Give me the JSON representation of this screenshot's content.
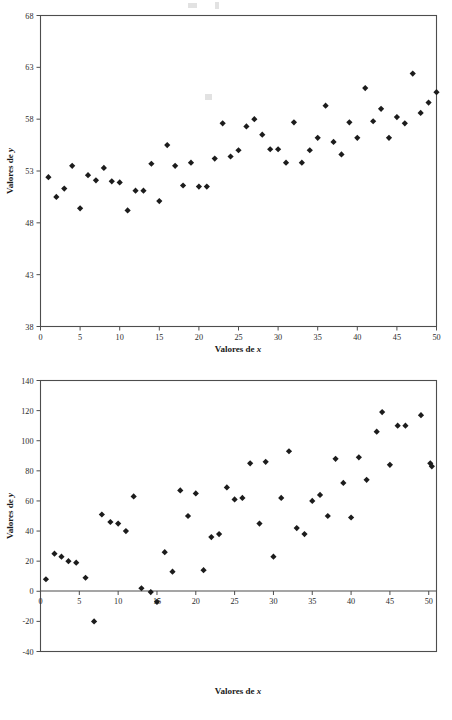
{
  "document": {
    "figure_count": 2,
    "background_color": "#ffffff",
    "marker_color": "#1c1c1c",
    "axis_color": "#4d4d4d"
  },
  "figures": [
    {
      "id": "figure-top",
      "xlabel_prefix": "Valores de ",
      "xlabel_var": "x",
      "ylabel_prefix": "Valores de ",
      "ylabel_var": "y"
    },
    {
      "id": "figure-bottom",
      "xlabel_prefix": "Valores de ",
      "xlabel_var": "x",
      "ylabel_prefix": "Valores de ",
      "ylabel_var": "y"
    }
  ],
  "chart_data": [
    {
      "type": "scatter",
      "title": "",
      "xlabel": "Valores de x",
      "ylabel": "Valores de y",
      "xlim": [
        0,
        50
      ],
      "ylim": [
        38,
        68
      ],
      "xticks": [
        0,
        5,
        10,
        15,
        20,
        25,
        30,
        35,
        40,
        45,
        50
      ],
      "yticks": [
        38,
        43,
        48,
        53,
        58,
        63,
        68
      ],
      "grid": false,
      "legend": null,
      "marker": "diamond",
      "series": [
        {
          "name": "y vs x",
          "x": [
            1,
            2,
            3,
            4,
            5,
            6,
            7,
            8,
            9,
            10,
            11,
            12,
            13,
            14,
            15,
            16,
            17,
            18,
            19,
            20,
            21,
            22,
            23,
            24,
            25,
            26,
            27,
            28,
            29,
            30,
            31,
            32,
            33,
            34,
            35,
            36,
            37,
            38,
            39,
            40,
            41,
            42,
            43,
            44,
            45,
            46,
            47,
            48,
            49,
            50
          ],
          "y": [
            52.4,
            50.5,
            51.3,
            53.5,
            49.4,
            52.6,
            52.1,
            53.3,
            52.0,
            51.9,
            49.2,
            51.1,
            51.1,
            53.7,
            50.1,
            55.5,
            53.5,
            51.6,
            53.8,
            51.5,
            51.5,
            54.2,
            57.6,
            54.4,
            55.0,
            57.3,
            58.0,
            56.5,
            55.1,
            55.1,
            53.8,
            57.7,
            53.8,
            55.0,
            56.2,
            59.3,
            55.8,
            54.6,
            57.7,
            56.2,
            61.0,
            57.8,
            59.0,
            56.2,
            58.2,
            57.6,
            62.4,
            58.6,
            59.6,
            60.6
          ]
        }
      ]
    },
    {
      "type": "scatter",
      "title": "",
      "xlabel": "Valores de x",
      "ylabel": "Valores de y",
      "xlim": [
        0,
        51
      ],
      "ylim": [
        -40,
        140
      ],
      "xticks": [
        0,
        5,
        10,
        15,
        20,
        25,
        30,
        35,
        40,
        45,
        50
      ],
      "yticks": [
        -40,
        -20,
        0,
        20,
        40,
        60,
        80,
        100,
        120,
        140
      ],
      "grid": false,
      "legend": null,
      "marker": "diamond",
      "series": [
        {
          "name": "y vs x",
          "x": [
            0.7,
            1.8,
            2.7,
            3.6,
            4.6,
            5.8,
            6.9,
            7.9,
            9.0,
            10.0,
            11.0,
            12.0,
            13.0,
            14.2,
            15.0,
            16.0,
            17.0,
            18.0,
            19.0,
            20.0,
            21.0,
            22.0,
            23.0,
            24.0,
            25.0,
            26.0,
            27.0,
            28.2,
            29.0,
            30.0,
            31.0,
            32.0,
            33.0,
            34.0,
            35.0,
            36.0,
            37.0,
            38.0,
            39.0,
            40.0,
            41.0,
            42.0,
            43.3,
            44.0,
            45.0,
            46.0,
            47.0,
            49.0,
            50.2,
            50.4
          ],
          "y": [
            8,
            25,
            23,
            20,
            19,
            9,
            -20,
            51,
            46,
            45,
            40,
            63,
            2,
            -0.5,
            -7,
            26,
            13,
            67,
            50,
            65,
            14,
            36,
            38,
            69,
            61,
            62,
            85,
            45,
            86,
            23,
            62,
            93,
            42,
            38,
            60,
            64,
            50,
            88,
            72,
            49,
            89,
            74,
            106,
            119,
            84,
            110,
            110,
            117,
            85,
            83
          ]
        }
      ]
    }
  ]
}
